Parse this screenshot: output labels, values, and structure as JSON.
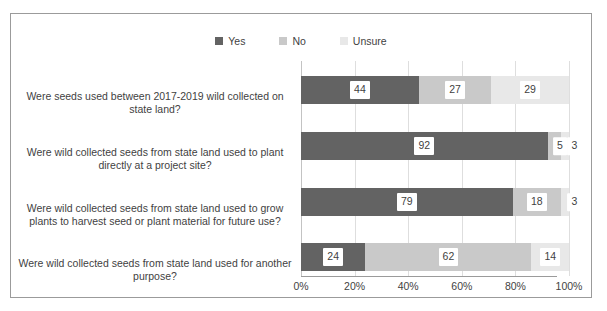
{
  "chart_data": {
    "type": "bar",
    "orientation": "horizontal",
    "stacked": "100%",
    "title": "",
    "xlabel": "",
    "ylabel": "",
    "xlim": [
      0,
      100
    ],
    "xticks": [
      "0%",
      "20%",
      "40%",
      "60%",
      "80%",
      "100%"
    ],
    "xtick_values": [
      0,
      20,
      40,
      60,
      80,
      100
    ],
    "grid": "vertical",
    "legend_position": "top",
    "categories": [
      "Were seeds used between 2017-2019 wild collected on state land?",
      "Were wild collected seeds from state land used to plant directly at a project site?",
      "Were wild collected seeds from state land used to grow plants to harvest seed or plant material for future use?",
      "Were wild collected seeds from state land used for another purpose?"
    ],
    "series": [
      {
        "name": "Yes",
        "color": "#636363",
        "values": [
          44,
          92,
          79,
          24
        ]
      },
      {
        "name": "No",
        "color": "#c9c9c9",
        "values": [
          27,
          5,
          18,
          62
        ]
      },
      {
        "name": "Unsure",
        "color": "#e8e8e8",
        "values": [
          29,
          3,
          3,
          14
        ]
      }
    ]
  },
  "legend": {
    "items": [
      {
        "label": "Yes",
        "color": "#636363"
      },
      {
        "label": "No",
        "color": "#c9c9c9"
      },
      {
        "label": "Unsure",
        "color": "#e8e8e8"
      }
    ]
  },
  "axis": {
    "ticks": [
      "0%",
      "20%",
      "40%",
      "60%",
      "80%",
      "100%"
    ]
  }
}
